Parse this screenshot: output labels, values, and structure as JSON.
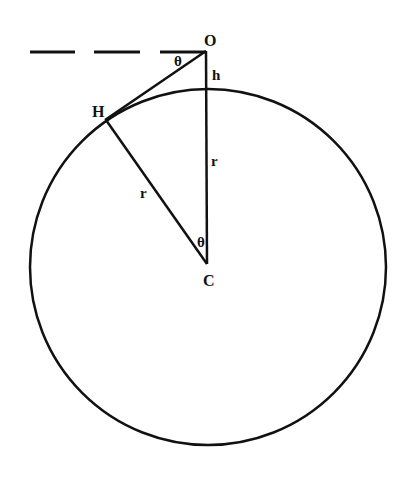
{
  "diagram": {
    "type": "geometry-horizon",
    "colors": {
      "stroke": "#111111",
      "background": "#ffffff"
    },
    "labels": {
      "observer": "O",
      "horizon_point": "H",
      "center": "C",
      "height": "h",
      "radius_vertical": "r",
      "radius_slant": "r",
      "angle_top": "θ",
      "angle_center": "θ"
    },
    "geometry": {
      "circle": {
        "cx": 208,
        "cy": 267,
        "r": 178
      },
      "O": [
        206,
        50
      ],
      "H": [
        106,
        120
      ],
      "C": [
        208,
        263
      ]
    }
  }
}
